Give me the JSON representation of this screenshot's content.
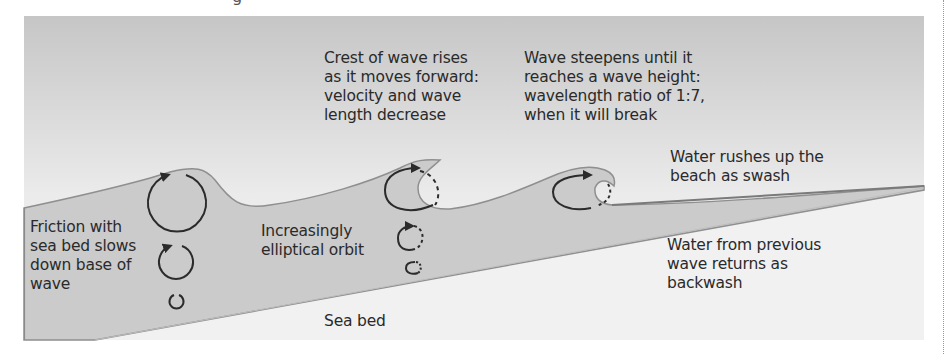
{
  "title_fragment": "g",
  "labels": {
    "crest": {
      "lines": [
        "Crest of wave rises",
        "as it moves forward:",
        "velocity and wave",
        "length decrease"
      ]
    },
    "steepen": {
      "lines": [
        "Wave steepens until it",
        "reaches a wave height:",
        "wavelength ratio of 1:7,",
        "when it will break"
      ]
    },
    "swash": {
      "lines": [
        "Water rushes up the",
        "beach as swash"
      ]
    },
    "friction": {
      "lines": [
        "Friction with",
        "sea bed slows",
        "down base of",
        "wave"
      ]
    },
    "elliptical": {
      "lines": [
        "Increasingly",
        "elliptical orbit"
      ]
    },
    "backwash": {
      "lines": [
        "Water from previous",
        "wave returns as",
        "backwash"
      ]
    },
    "seabed": {
      "lines": [
        "Sea bed"
      ]
    }
  },
  "colors": {
    "sky_top": "#c9c9c9",
    "sky_bottom": "#f4f4f4",
    "water": "#cbcbcb",
    "water_edge": "#8a8a8a",
    "seabed": "#f2f2f2",
    "orbit_stroke": "#2b2b2b",
    "text": "#2a2a2a"
  }
}
